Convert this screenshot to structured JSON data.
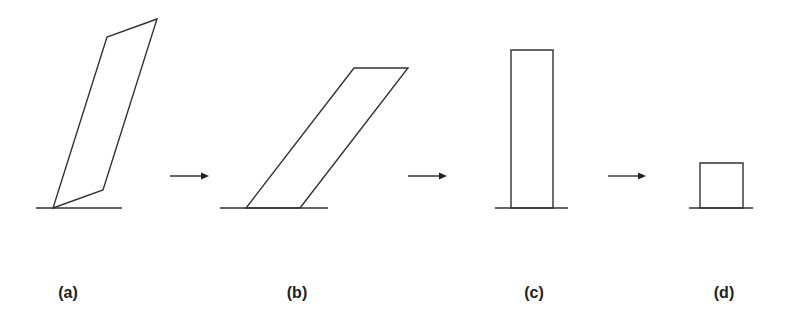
{
  "diagram": {
    "stroke_color": "#333333",
    "background": "#ffffff",
    "panels": [
      {
        "label": "(a)",
        "shape": "tilted-quadrilateral",
        "points": "53,208 103,190 157,19 107,37",
        "ground": {
          "x1": 36,
          "x2": 122,
          "y": 208
        },
        "label_x": 68
      },
      {
        "label": "(b)",
        "shape": "sheared-parallelogram",
        "points": "246,208 300,208 408,68 354,68",
        "ground": {
          "x1": 220,
          "x2": 328,
          "y": 208
        },
        "label_x": 297
      },
      {
        "label": "(c)",
        "shape": "tall-rectangle",
        "points": "511,208 553,208 553,50 511,50",
        "ground": {
          "x1": 495,
          "x2": 568,
          "y": 208
        },
        "label_x": 534
      },
      {
        "label": "(d)",
        "shape": "short-square",
        "points": "700,208 743,208 743,163 700,163",
        "ground": {
          "x1": 689,
          "x2": 753,
          "y": 208
        },
        "label_x": 724
      }
    ],
    "arrows": [
      {
        "x1": 170,
        "x2": 209,
        "y": 176
      },
      {
        "x1": 408,
        "x2": 447,
        "y": 176
      },
      {
        "x1": 608,
        "x2": 646,
        "y": 176
      }
    ]
  }
}
